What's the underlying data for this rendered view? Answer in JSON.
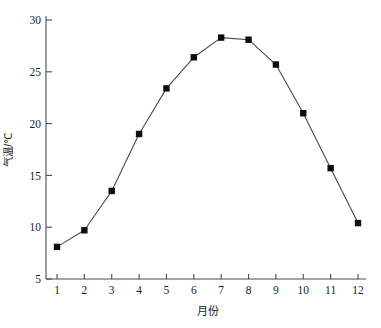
{
  "chart_data": {
    "type": "line",
    "title": "",
    "xlabel": "月份",
    "ylabel": "气温/℃",
    "categories": [
      "1",
      "2",
      "3",
      "4",
      "5",
      "6",
      "7",
      "8",
      "9",
      "10",
      "11",
      "12"
    ],
    "values": [
      8.1,
      9.7,
      13.5,
      19.0,
      23.4,
      26.4,
      28.3,
      28.1,
      25.7,
      21.0,
      15.7,
      10.4
    ],
    "series": [
      {
        "name": "气温",
        "values": [
          8.1,
          9.7,
          13.5,
          19.0,
          23.4,
          26.4,
          28.3,
          28.1,
          25.7,
          21.0,
          15.7,
          10.4
        ]
      }
    ],
    "xlim": [
      1,
      12
    ],
    "ylim": [
      5,
      30
    ],
    "ytick_labels": [
      "5",
      "10",
      "15",
      "20",
      "25",
      "30"
    ],
    "ytick_values": [
      5,
      10,
      15,
      20,
      25,
      30
    ],
    "xtick_labels": [
      "1",
      "2",
      "3",
      "4",
      "5",
      "6",
      "7",
      "8",
      "9",
      "10",
      "11",
      "12"
    ],
    "grid": false,
    "legend": false,
    "marker": "filled-square",
    "marker_color": "#0d0d0d",
    "line_color": "#4a4a4a",
    "axis_color": "#4d4d4d",
    "background_color": "#ffffff"
  }
}
